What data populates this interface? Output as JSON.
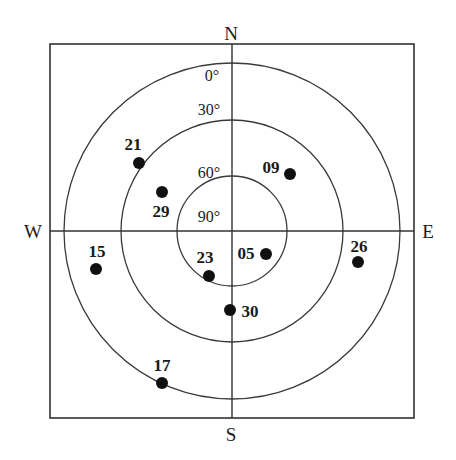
{
  "chart_data": {
    "type": "scatter",
    "subtype": "polar-skyplot",
    "title": "",
    "xlabel": "",
    "ylabel": "",
    "projection": "azimuth-elevation skyplot",
    "grid": true,
    "legend": null,
    "compass_labels": [
      "N",
      "E",
      "S",
      "W"
    ],
    "elevation_rings": [
      {
        "label": "0°",
        "value": 0,
        "radius_px": 168
      },
      {
        "label": "30°",
        "value": 30,
        "radius_px": 111
      },
      {
        "label": "60°",
        "value": 60,
        "radius_px": 55
      },
      {
        "label": "90°",
        "value": 90,
        "radius_px": 0
      }
    ],
    "elevation_tick_labels": [
      "0°",
      "30°",
      "60°",
      "90°"
    ],
    "center_px": {
      "x": 232,
      "y": 231
    },
    "frame_px": {
      "x": 50,
      "y": 44,
      "width": 364,
      "height": 374
    },
    "point_radius_px": 6,
    "points": [
      {
        "id": "21",
        "x_px": 139,
        "y_px": 163,
        "label_x_px": 133,
        "label_y_px": 144,
        "azimuth_deg": 307,
        "elevation_deg": 28
      },
      {
        "id": "09",
        "x_px": 290,
        "y_px": 174,
        "label_x_px": 271,
        "label_y_px": 167,
        "azimuth_deg": 39,
        "elevation_deg": 44
      },
      {
        "id": "29",
        "x_px": 162,
        "y_px": 192,
        "label_x_px": 161,
        "label_y_px": 211,
        "azimuth_deg": 299,
        "elevation_deg": 49
      },
      {
        "id": "15",
        "x_px": 96,
        "y_px": 269,
        "label_x_px": 97,
        "label_y_px": 251,
        "azimuth_deg": 254,
        "elevation_deg": 17
      },
      {
        "id": "26",
        "x_px": 358,
        "y_px": 262,
        "label_x_px": 359,
        "label_y_px": 246,
        "azimuth_deg": 104,
        "elevation_deg": 22
      },
      {
        "id": "05",
        "x_px": 266,
        "y_px": 254,
        "label_x_px": 246,
        "label_y_px": 253,
        "azimuth_deg": 124,
        "elevation_deg": 68
      },
      {
        "id": "23",
        "x_px": 209,
        "y_px": 276,
        "label_x_px": 205,
        "label_y_px": 257,
        "azimuth_deg": 207,
        "elevation_deg": 63
      },
      {
        "id": "30",
        "x_px": 230,
        "y_px": 310,
        "label_x_px": 250,
        "label_y_px": 311,
        "azimuth_deg": 182,
        "elevation_deg": 48
      },
      {
        "id": "17",
        "x_px": 162,
        "y_px": 383,
        "label_x_px": 162,
        "label_y_px": 365,
        "azimuth_deg": 216,
        "elevation_deg": 2
      }
    ],
    "colors": {
      "point": "#111111",
      "grid": "#3a3a3a",
      "frame": "#333333",
      "text": "#1a1a1a",
      "background": "#ffffff"
    }
  },
  "compass": {
    "north": {
      "label": "N",
      "x_px": 231,
      "y_px": 33
    },
    "south": {
      "label": "S",
      "x_px": 231,
      "y_px": 434
    },
    "west": {
      "label": "W",
      "x_px": 33,
      "y_px": 231
    },
    "east": {
      "label": "E",
      "x_px": 428,
      "y_px": 231
    }
  },
  "elevation_ticks": [
    {
      "label": "0°",
      "x_px": 212,
      "y_px": 76
    },
    {
      "label": "30°",
      "x_px": 209,
      "y_px": 110
    },
    {
      "label": "60°",
      "x_px": 209,
      "y_px": 173
    },
    {
      "label": "90°",
      "x_px": 209,
      "y_px": 217
    }
  ]
}
